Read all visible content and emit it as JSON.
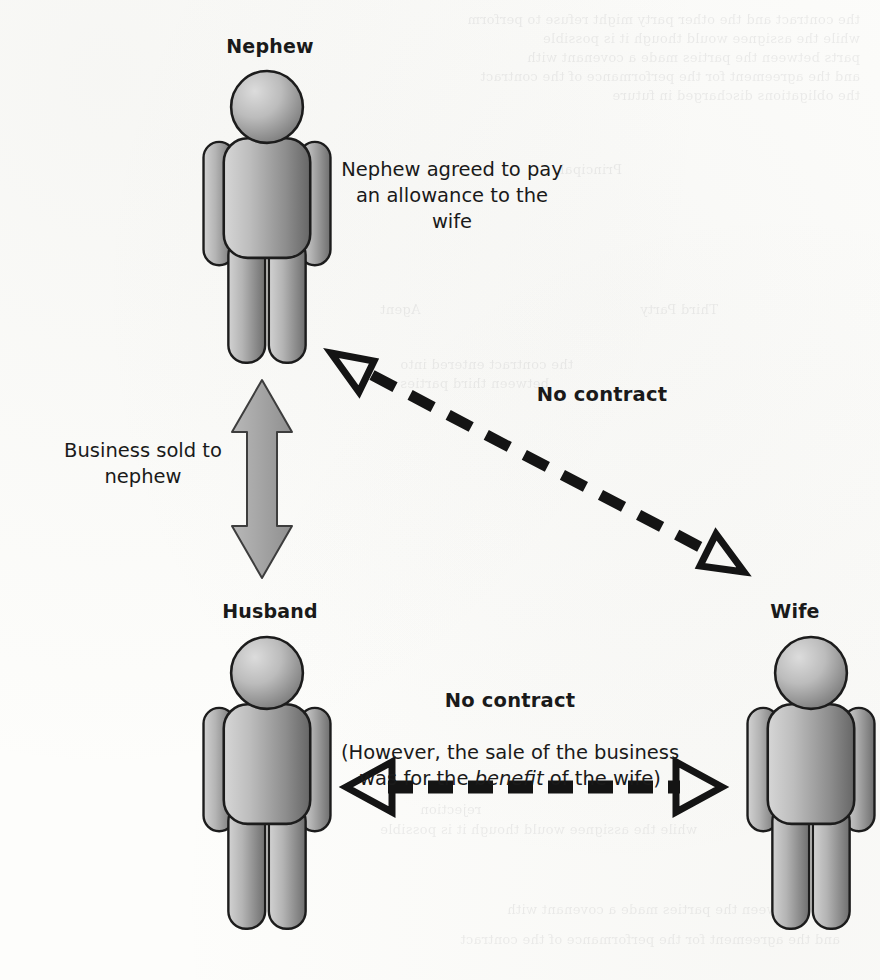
{
  "diagram": {
    "type": "relationship-diagram",
    "background_color": "#fdfdfb",
    "figure_fill_light": "#c9c9c9",
    "figure_fill_dark": "#6f6f6f",
    "figure_outline": "#1c1c1c",
    "solid_arrow_color": "#a3a3a3",
    "dashed_arrow_color": "#141414"
  },
  "actors": [
    {
      "id": "nephew",
      "label": "Nephew",
      "position": "top-left"
    },
    {
      "id": "husband",
      "label": "Husband",
      "position": "bottom-left"
    },
    {
      "id": "wife",
      "label": "Wife",
      "position": "bottom-right"
    }
  ],
  "relationships": [
    {
      "id": "nephew-husband",
      "from": "husband",
      "to": "nephew",
      "style": "solid-double-arrow",
      "label": "Business sold to\nnephew",
      "label_bold": false
    },
    {
      "id": "nephew-wife",
      "from": "wife",
      "to": "nephew",
      "style": "dashed-double-arrow",
      "label": "No contract",
      "label_bold": true,
      "side_note": "Nephew agreed to pay\nan allowance to the\nwife"
    },
    {
      "id": "husband-wife",
      "from": "husband",
      "to": "wife",
      "style": "dashed-double-arrow",
      "label": "No contract",
      "label_bold": true,
      "sub_label_prefix": "(However, the sale of the business\nwas for the ",
      "sub_label_emphasis": "benefit",
      "sub_label_suffix": " of the wife)"
    }
  ],
  "bleed_through": {
    "lines": [
      "the contract and the other party might refuse to perform",
      "while the assignee would though it is possible",
      "parts between the parties made a covenant with",
      "and the agreement for the performance of the contract",
      "the obligations discharged in future"
    ],
    "lines2": [
      "Third Party",
      "Agent",
      "Principal"
    ],
    "lines3": [
      "the contract entered into",
      "between third parties",
      "rejection"
    ]
  }
}
